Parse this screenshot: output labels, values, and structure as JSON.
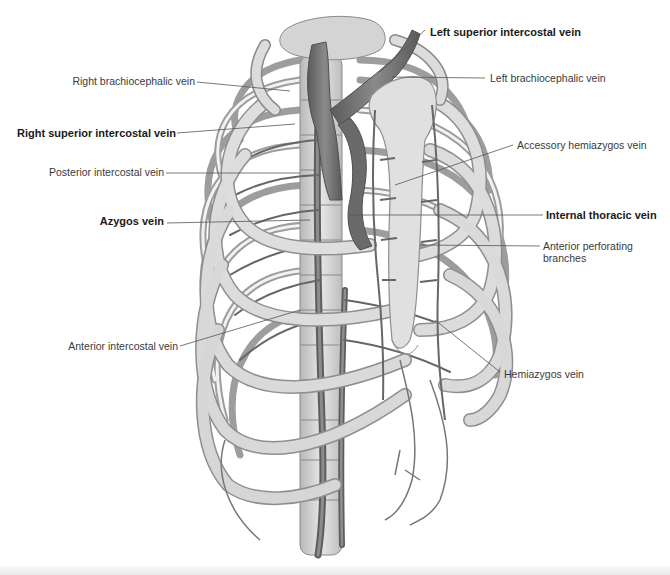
{
  "figure": {
    "colors": {
      "bone": "#d9d9d9",
      "bone_shadow": "#9a9a9a",
      "vein": "#6e6e6e",
      "vein_dark": "#555555",
      "leader": "#555555"
    }
  },
  "labels": {
    "left": [
      {
        "id": "right-brachiocephalic-vein",
        "text": "Right brachiocephalic vein",
        "bold": false
      },
      {
        "id": "right-superior-intercostal-vein",
        "text": "Right superior intercostal vein",
        "bold": true
      },
      {
        "id": "posterior-intercostal-vein",
        "text": "Posterior intercostal vein",
        "bold": false
      },
      {
        "id": "azygos-vein",
        "text": "Azygos vein",
        "bold": true
      },
      {
        "id": "anterior-intercostal-vein",
        "text": "Anterior intercostal vein",
        "bold": false
      }
    ],
    "right": [
      {
        "id": "left-superior-intercostal-vein",
        "text": "Left superior intercostal vein",
        "bold": true
      },
      {
        "id": "left-brachiocephalic-vein",
        "text": "Left brachiocephalic vein",
        "bold": false
      },
      {
        "id": "accessory-hemiazygos-vein",
        "text": "Accessory hemiazygos vein",
        "bold": false
      },
      {
        "id": "internal-thoracic-vein",
        "text": "Internal thoracic vein",
        "bold": true
      },
      {
        "id": "anterior-perforating-branches",
        "text": "Anterior perforating\nbranches",
        "bold": false,
        "line1": "Anterior perforating",
        "line2": "branches"
      },
      {
        "id": "hemiazygos-vein",
        "text": "Hemiazygos vein",
        "bold": false
      }
    ]
  }
}
